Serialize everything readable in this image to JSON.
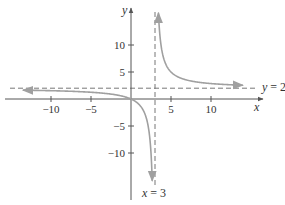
{
  "chart_data": {
    "type": "line",
    "title": "",
    "function": "y = 2x/(x - 3)",
    "xlabel": "x",
    "ylabel": "y",
    "xlim": [
      -14,
      15
    ],
    "ylim": [
      -18,
      17
    ],
    "x_ticks": [
      -10,
      -5,
      5,
      10
    ],
    "x_tick_labels": [
      "−10",
      "−5",
      "5",
      "10"
    ],
    "y_ticks": [
      -10,
      -5,
      5,
      10
    ],
    "y_tick_labels": [
      "−10",
      "−5",
      "5",
      "10"
    ],
    "grid": false,
    "series": [
      {
        "name": "left branch",
        "color": "#a0a0a0",
        "x": [
          -13.5,
          -10,
          -8,
          -6,
          -4,
          -2,
          -1,
          0,
          1,
          1.5,
          2,
          2.3,
          2.5,
          2.65
        ],
        "values": [
          1.59,
          1.54,
          1.45,
          1.33,
          1.14,
          0.8,
          0.5,
          0,
          -1,
          -2,
          -4,
          -6.57,
          -10,
          -15.1
        ]
      },
      {
        "name": "right branch",
        "color": "#a0a0a0",
        "x": [
          3.43,
          3.6,
          4,
          4.5,
          5,
          6,
          7,
          8,
          10,
          12,
          14
        ],
        "values": [
          15.95,
          12,
          8,
          6,
          5,
          4,
          3.5,
          3.2,
          2.86,
          2.67,
          2.55
        ]
      }
    ],
    "asymptotes": [
      {
        "type": "vertical",
        "value": 3,
        "label": "x = 3",
        "style": "dashed"
      },
      {
        "type": "horizontal",
        "value": 2,
        "label": "y = 2",
        "style": "dashed"
      }
    ]
  },
  "labels": {
    "x_axis": "x",
    "y_axis": "y",
    "vertical_asymptote": {
      "var": "x",
      "eq": " = 3"
    },
    "horizontal_asymptote": {
      "var": "y",
      "eq": " = 2"
    }
  },
  "colors": {
    "axis": "#555555",
    "curve": "#a0a0a0",
    "asymptote": "#777777",
    "text": "#333333"
  }
}
